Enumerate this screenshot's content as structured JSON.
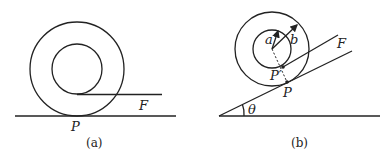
{
  "figures": [
    {
      "id": "a",
      "caption": "(a)",
      "labels": {
        "force": "F",
        "contact": "P"
      },
      "description": "Spool with inner radius and outer radius resting on horizontal ground; string pulled horizontally from bottom of inner hub with force F; contact point P."
    },
    {
      "id": "b",
      "caption": "(b)",
      "labels": {
        "inner_radius": "a",
        "outer_radius": "b",
        "force": "F",
        "inner_contact": "P′",
        "contact": "P",
        "angle": "θ"
      },
      "description": "Spool on incline of angle θ; string pulled parallel to incline from inner hub point P′ with force F; contact point P; radii a and b shown with arrows."
    }
  ],
  "colors": {
    "line": "#222222",
    "background": "#ffffff"
  }
}
